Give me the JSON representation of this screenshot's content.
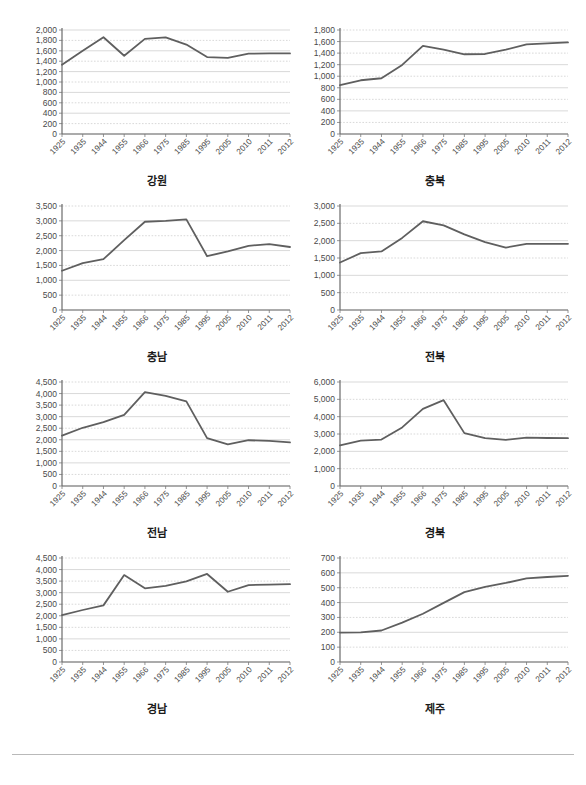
{
  "page": {
    "background_color": "#ffffff",
    "line_color": "#5f5f5f",
    "grid_color": "#c9c9c9",
    "axis_color": "#7a7a7a",
    "text_color": "#4a4a4a"
  },
  "chart_data": [
    {
      "type": "line",
      "title": "강원",
      "xlabel": "",
      "ylabel": "",
      "x": [
        "1925",
        "1935",
        "1944",
        "1955",
        "1966",
        "1975",
        "1985",
        "1995",
        "2005",
        "2010",
        "2011",
        "2012"
      ],
      "values": [
        1330,
        1600,
        1860,
        1505,
        1830,
        1860,
        1720,
        1480,
        1465,
        1545,
        1550,
        1550
      ],
      "ylim": [
        0,
        2000
      ],
      "ytick_step": 200,
      "yticks": [
        "0",
        "200",
        "400",
        "600",
        "800",
        "1,000",
        "1,200",
        "1,400",
        "1,600",
        "1,800",
        "2,000"
      ],
      "grid": true,
      "legend": "none"
    },
    {
      "type": "line",
      "title": "충북",
      "xlabel": "",
      "ylabel": "",
      "x": [
        "1925",
        "1935",
        "1944",
        "1955",
        "1966",
        "1975",
        "1985",
        "1995",
        "2005",
        "2010",
        "2011",
        "2012"
      ],
      "values": [
        845,
        930,
        965,
        1195,
        1525,
        1460,
        1380,
        1385,
        1460,
        1550,
        1570,
        1585
      ],
      "ylim": [
        0,
        1800
      ],
      "ytick_step": 200,
      "yticks": [
        "0",
        "200",
        "400",
        "600",
        "800",
        "1,000",
        "1,200",
        "1,400",
        "1,600",
        "1,800"
      ],
      "grid": true,
      "legend": "none"
    },
    {
      "type": "line",
      "title": "충남",
      "xlabel": "",
      "ylabel": "",
      "x": [
        "1925",
        "1935",
        "1944",
        "1955",
        "1966",
        "1975",
        "1985",
        "1995",
        "2005",
        "2010",
        "2011",
        "2012"
      ],
      "values": [
        1320,
        1580,
        1710,
        2350,
        2970,
        3000,
        3050,
        1810,
        1970,
        2160,
        2220,
        2120
      ],
      "ylim": [
        0,
        3500
      ],
      "ytick_step": 500,
      "yticks": [
        "0",
        "500",
        "1,000",
        "1,500",
        "2,000",
        "2,500",
        "3,000",
        "3,500"
      ],
      "grid": true,
      "legend": "none"
    },
    {
      "type": "line",
      "title": "전북",
      "xlabel": "",
      "ylabel": "",
      "x": [
        "1925",
        "1935",
        "1944",
        "1955",
        "1966",
        "1975",
        "1985",
        "1995",
        "2005",
        "2010",
        "2011",
        "2012"
      ],
      "values": [
        1370,
        1640,
        1690,
        2080,
        2560,
        2440,
        2180,
        1960,
        1800,
        1910,
        1910,
        1910
      ],
      "ylim": [
        0,
        3000
      ],
      "ytick_step": 500,
      "yticks": [
        "0",
        "500",
        "1,000",
        "1,500",
        "2,000",
        "2,500",
        "3,000"
      ],
      "grid": true,
      "legend": "none"
    },
    {
      "type": "line",
      "title": "전남",
      "xlabel": "",
      "ylabel": "",
      "x": [
        "1925",
        "1935",
        "1944",
        "1955",
        "1966",
        "1975",
        "1985",
        "1995",
        "2005",
        "2010",
        "2011",
        "2012"
      ],
      "values": [
        2180,
        2520,
        2760,
        3080,
        4060,
        3900,
        3660,
        2070,
        1800,
        1980,
        1950,
        1890
      ],
      "ylim": [
        0,
        4500
      ],
      "ytick_step": 500,
      "yticks": [
        "0",
        "500",
        "1,000",
        "1,500",
        "2,000",
        "2,500",
        "3,000",
        "3,500",
        "4,000",
        "4,500"
      ],
      "grid": true,
      "legend": "none"
    },
    {
      "type": "line",
      "title": "경북",
      "xlabel": "",
      "ylabel": "",
      "x": [
        "1925",
        "1935",
        "1944",
        "1955",
        "1966",
        "1975",
        "1985",
        "1995",
        "2005",
        "2010",
        "2011",
        "2012"
      ],
      "values": [
        2350,
        2620,
        2680,
        3380,
        4450,
        4950,
        3050,
        2760,
        2660,
        2790,
        2770,
        2760
      ],
      "ylim": [
        0,
        6000
      ],
      "ytick_step": 1000,
      "yticks": [
        "0",
        "1,000",
        "2,000",
        "3,000",
        "4,000",
        "5,000",
        "6,000"
      ],
      "grid": true,
      "legend": "none"
    },
    {
      "type": "line",
      "title": "경남",
      "xlabel": "",
      "ylabel": "",
      "x": [
        "1925",
        "1935",
        "1944",
        "1955",
        "1966",
        "1975",
        "1985",
        "1995",
        "2005",
        "2010",
        "2011",
        "2012"
      ],
      "values": [
        2030,
        2250,
        2450,
        3760,
        3190,
        3290,
        3490,
        3810,
        3040,
        3330,
        3350,
        3370
      ],
      "ylim": [
        0,
        4500
      ],
      "ytick_step": 500,
      "yticks": [
        "0",
        "500",
        "1,000",
        "1,500",
        "2,000",
        "2,500",
        "3,000",
        "3,500",
        "4,000",
        "4,500"
      ],
      "grid": true,
      "legend": "none"
    },
    {
      "type": "line",
      "title": "제주",
      "xlabel": "",
      "ylabel": "",
      "x": [
        "1925",
        "1935",
        "1944",
        "1955",
        "1966",
        "1975",
        "1985",
        "1995",
        "2005",
        "2010",
        "2011",
        "2012"
      ],
      "values": [
        198,
        200,
        212,
        265,
        325,
        398,
        470,
        505,
        532,
        563,
        572,
        580
      ],
      "ylim": [
        0,
        700
      ],
      "ytick_step": 100,
      "yticks": [
        "0",
        "100",
        "200",
        "300",
        "400",
        "500",
        "600",
        "700"
      ],
      "grid": true,
      "legend": "none"
    }
  ]
}
